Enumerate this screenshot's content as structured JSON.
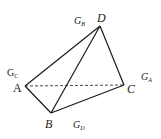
{
  "diagram": {
    "type": "tetrahedron",
    "vertices": [
      {
        "id": "A",
        "label": "A",
        "x": 25,
        "y": 86,
        "lx": 13,
        "ly": 92
      },
      {
        "id": "B",
        "label": "B",
        "x": 51,
        "y": 113,
        "lx": 45,
        "ly": 128
      },
      {
        "id": "C",
        "label": "C",
        "x": 124,
        "y": 85,
        "lx": 127,
        "ly": 93
      },
      {
        "id": "D",
        "label": "D",
        "x": 100,
        "y": 26,
        "lx": 97,
        "ly": 22
      }
    ],
    "edges": [
      {
        "from": "A",
        "to": "D",
        "style": "solid"
      },
      {
        "from": "B",
        "to": "D",
        "style": "solid"
      },
      {
        "from": "C",
        "to": "D",
        "style": "solid"
      },
      {
        "from": "A",
        "to": "B",
        "style": "solid"
      },
      {
        "from": "B",
        "to": "C",
        "style": "solid"
      },
      {
        "from": "A",
        "to": "C",
        "style": "dashed"
      }
    ],
    "centroid_labels": [
      {
        "id": "G_B",
        "base": "G",
        "sub": "B",
        "x": 74,
        "y": 24
      },
      {
        "id": "G_C",
        "base": "G",
        "sub": "C",
        "x": 7,
        "y": 76
      },
      {
        "id": "G_A",
        "base": "G",
        "sub": "A",
        "x": 141,
        "y": 80
      },
      {
        "id": "G_D",
        "base": "G",
        "sub": "D",
        "x": 73,
        "y": 128
      }
    ],
    "line_color": "#1a1a1a"
  },
  "labels": {
    "A": "A",
    "B": "B",
    "C": "C",
    "D": "D",
    "G": "G",
    "sub_A": "A",
    "sub_B": "B",
    "sub_C": "C",
    "sub_D": "D"
  }
}
